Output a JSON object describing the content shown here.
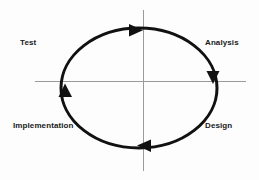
{
  "diagram": {
    "type": "cyclic-process",
    "background_color": "#fdfdfd",
    "stroke_color": "#111111",
    "axis_color": "#9a9a9a",
    "labels": [
      {
        "id": "test",
        "text": "Test",
        "quadrant": "top-left"
      },
      {
        "id": "analysis",
        "text": "Analysis",
        "quadrant": "top-right"
      },
      {
        "id": "design",
        "text": "Design",
        "quadrant": "bottom-right"
      },
      {
        "id": "implementation",
        "text": "Implementation",
        "quadrant": "bottom-left"
      }
    ],
    "ellipse": {
      "cx": 139,
      "cy": 88,
      "rx": 78,
      "ry": 60,
      "stroke_width": 3
    },
    "axes": {
      "horizontal": {
        "x1": 35,
        "y1": 81,
        "x2": 246,
        "y2": 81
      },
      "vertical": {
        "x1": 143,
        "y1": 10,
        "x2": 143,
        "y2": 171
      }
    },
    "arrows": [
      {
        "id": "arrow-top",
        "direction": "right",
        "x": 136,
        "y": 30
      },
      {
        "id": "arrow-right",
        "direction": "down",
        "x": 213,
        "y": 78
      },
      {
        "id": "arrow-bottom",
        "direction": "left",
        "x": 143,
        "y": 145
      },
      {
        "id": "arrow-left",
        "direction": "up",
        "x": 65,
        "y": 90
      }
    ],
    "flow_order": [
      "Analysis",
      "Design",
      "Implementation",
      "Test"
    ]
  }
}
